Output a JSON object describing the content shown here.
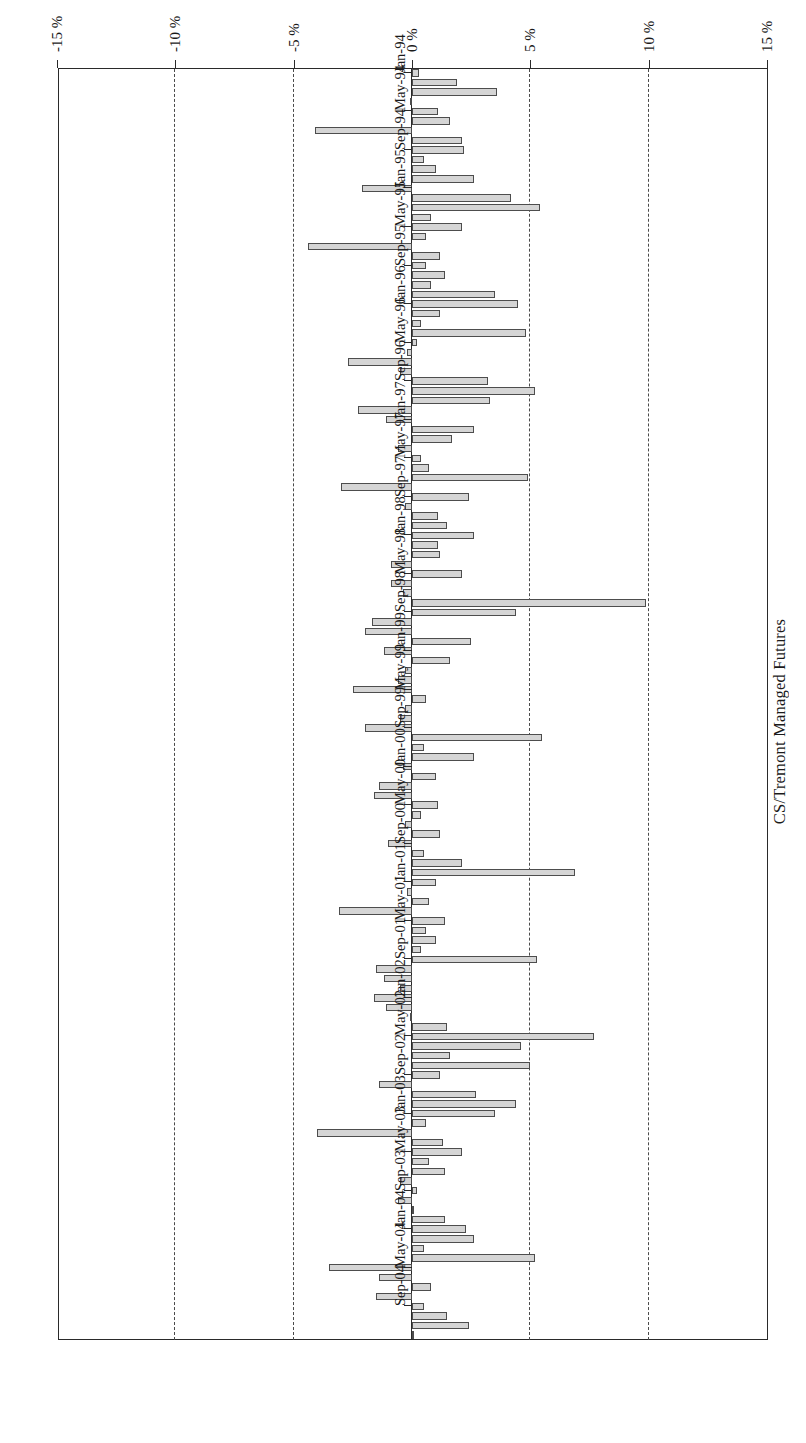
{
  "chart_data": {
    "type": "bar",
    "orientation": "horizontal",
    "title": "CS/Tremont Managed Futures",
    "xlabel": "",
    "ylabel": "",
    "grid": true,
    "legend": null,
    "rotated_180": true,
    "value_axis": {
      "ticks": [
        "15 %",
        "10 %",
        "5 %",
        "0 %",
        "-5 %",
        "-10 %",
        "-15 %"
      ],
      "tick_values": [
        15,
        10,
        5,
        0,
        -5,
        -10,
        -15
      ],
      "min": -15,
      "max": 15,
      "unit": "%"
    },
    "category_axis": {
      "labelled_ticks": [
        "Jan-94",
        "May-94",
        "Sep-94",
        "Jan-95",
        "May-95",
        "Sep-95",
        "Jan-96",
        "May-96",
        "Sep-96",
        "Jan-97",
        "May-97",
        "Sep-97",
        "Jan-98",
        "May-98",
        "Sep-98",
        "Jan-99",
        "May-99",
        "Sep-99",
        "Jan-00",
        "May-00",
        "Sep-00",
        "Jan-01",
        "May-01",
        "Sep-01",
        "Jan-02",
        "May-02",
        "Sep-02",
        "Jan-03",
        "May-03",
        "Sep-03",
        "Jan-04",
        "May-04",
        "Sep-04"
      ],
      "label_interval_months": 4
    },
    "categories": [
      "Jan-94",
      "Feb-94",
      "Mar-94",
      "Apr-94",
      "May-94",
      "Jun-94",
      "Jul-94",
      "Aug-94",
      "Sep-94",
      "Oct-94",
      "Nov-94",
      "Dec-94",
      "Jan-95",
      "Feb-95",
      "Mar-95",
      "Apr-95",
      "May-95",
      "Jun-95",
      "Jul-95",
      "Aug-95",
      "Sep-95",
      "Oct-95",
      "Nov-95",
      "Dec-95",
      "Jan-96",
      "Feb-96",
      "Mar-96",
      "Apr-96",
      "May-96",
      "Jun-96",
      "Jul-96",
      "Aug-96",
      "Sep-96",
      "Oct-96",
      "Nov-96",
      "Dec-96",
      "Jan-97",
      "Feb-97",
      "Mar-97",
      "Apr-97",
      "May-97",
      "Jun-97",
      "Jul-97",
      "Aug-97",
      "Sep-97",
      "Oct-97",
      "Nov-97",
      "Dec-97",
      "Jan-98",
      "Feb-98",
      "Mar-98",
      "Apr-98",
      "May-98",
      "Jun-98",
      "Jul-98",
      "Aug-98",
      "Sep-98",
      "Oct-98",
      "Nov-98",
      "Dec-98",
      "Jan-99",
      "Feb-99",
      "Mar-99",
      "Apr-99",
      "May-99",
      "Jun-99",
      "Jul-99",
      "Aug-99",
      "Sep-99",
      "Oct-99",
      "Nov-99",
      "Dec-99",
      "Jan-00",
      "Feb-00",
      "Mar-00",
      "Apr-00",
      "May-00",
      "Jun-00",
      "Jul-00",
      "Aug-00",
      "Sep-00",
      "Oct-00",
      "Nov-00",
      "Dec-00",
      "Jan-01",
      "Feb-01",
      "Mar-01",
      "Apr-01",
      "May-01",
      "Jun-01",
      "Jul-01",
      "Aug-01",
      "Sep-01",
      "Oct-01",
      "Nov-01",
      "Dec-01",
      "Jan-02",
      "Feb-02",
      "Mar-02",
      "Apr-02",
      "May-02",
      "Jun-02",
      "Jul-02",
      "Aug-02",
      "Sep-02",
      "Oct-02",
      "Nov-02",
      "Dec-02",
      "Jan-03",
      "Feb-03",
      "Mar-03",
      "Apr-03",
      "May-03",
      "Jun-03",
      "Jul-03",
      "Aug-03",
      "Sep-03",
      "Oct-03",
      "Nov-03",
      "Dec-03",
      "Jan-04",
      "Feb-04",
      "Mar-04",
      "Apr-04",
      "May-04",
      "Jun-04",
      "Jul-04",
      "Aug-04",
      "Sep-04",
      "Oct-04",
      "Nov-04",
      "Dec-04"
    ],
    "values": [
      0.3,
      1.9,
      3.6,
      -0.1,
      1.1,
      1.6,
      -4.1,
      2.1,
      2.2,
      0.5,
      1.0,
      2.6,
      -2.1,
      4.2,
      5.4,
      0.8,
      2.1,
      0.6,
      -4.4,
      1.2,
      0.6,
      1.4,
      0.8,
      3.5,
      4.5,
      1.2,
      0.4,
      4.8,
      0.2,
      -0.2,
      -2.7,
      -0.5,
      3.2,
      5.2,
      3.3,
      -2.3,
      -1.1,
      2.6,
      1.7,
      -0.6,
      0.4,
      0.7,
      4.9,
      -3.0,
      2.4,
      -0.3,
      1.1,
      1.5,
      2.6,
      1.1,
      1.2,
      -0.9,
      2.1,
      -0.9,
      -0.4,
      9.9,
      4.4,
      -1.7,
      -2.0,
      2.5,
      -1.2,
      1.6,
      -0.3,
      -0.6,
      -2.5,
      0.6,
      -0.3,
      -0.5,
      -2.0,
      5.5,
      0.5,
      2.6,
      -0.4,
      1.0,
      -1.4,
      -1.6,
      1.1,
      0.4,
      -0.3,
      1.2,
      -1.0,
      0.5,
      2.1,
      6.9,
      1.0,
      -0.2,
      0.7,
      -3.1,
      1.4,
      0.6,
      1.0,
      0.4,
      5.3,
      -1.5,
      -1.2,
      -0.5,
      -1.6,
      -1.1,
      -0.1,
      1.5,
      7.7,
      4.6,
      1.6,
      5.0,
      1.2,
      -1.4,
      2.7,
      4.4,
      3.5,
      0.6,
      -4.0,
      1.3,
      2.1,
      0.7,
      1.4,
      -0.5,
      0.2,
      -0.6,
      0.1,
      1.4,
      2.3,
      2.6,
      0.5,
      5.2,
      -3.5,
      -1.4,
      0.8,
      -1.5,
      0.5,
      1.5,
      2.4,
      0.1
    ]
  },
  "axis": {
    "tick_labels": [
      "15 %",
      "10 %",
      "5 %",
      "0 %",
      "-5 %",
      "-10 %",
      "-15 %"
    ]
  },
  "title": {
    "text": "CS/Tremont Managed Futures"
  }
}
